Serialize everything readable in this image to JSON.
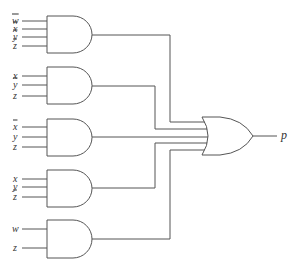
{
  "diagram": {
    "type": "logic-circuit",
    "output": {
      "label": "p"
    },
    "gates": [
      {
        "id": "and1",
        "type": "AND",
        "inputs": [
          {
            "label": "w",
            "negated": true
          },
          {
            "label": "x",
            "negated": true
          },
          {
            "label": "y",
            "negated": true
          },
          {
            "label": "z",
            "negated": true
          }
        ]
      },
      {
        "id": "and2",
        "type": "AND",
        "inputs": [
          {
            "label": "x",
            "negated": false
          },
          {
            "label": "y",
            "negated": true
          },
          {
            "label": "z",
            "negated": false
          }
        ]
      },
      {
        "id": "and3",
        "type": "AND",
        "inputs": [
          {
            "label": "x",
            "negated": true
          },
          {
            "label": "y",
            "negated": false
          },
          {
            "label": "z",
            "negated": false
          }
        ]
      },
      {
        "id": "and4",
        "type": "AND",
        "inputs": [
          {
            "label": "x",
            "negated": false
          },
          {
            "label": "y",
            "negated": false
          },
          {
            "label": "z",
            "negated": true
          }
        ]
      },
      {
        "id": "and5",
        "type": "AND",
        "inputs": [
          {
            "label": "w",
            "negated": false
          },
          {
            "label": "z",
            "negated": false
          }
        ]
      },
      {
        "id": "or1",
        "type": "OR",
        "inputs_from": [
          "and1",
          "and2",
          "and3",
          "and4",
          "and5"
        ]
      }
    ]
  }
}
